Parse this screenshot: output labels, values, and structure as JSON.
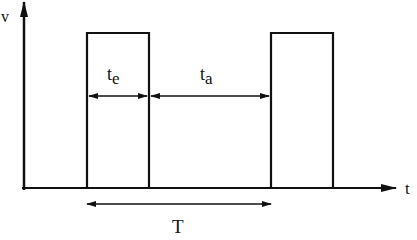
{
  "diagram": {
    "type": "pulse-timing-diagram",
    "axes": {
      "y_label": "v",
      "x_label": "t"
    },
    "labels": {
      "pulse_width": "t",
      "pulse_width_sub": "e",
      "gap": "t",
      "gap_sub": "a",
      "period": "T"
    },
    "pulses": [
      {
        "x_start": 87,
        "x_end": 149
      },
      {
        "x_start": 271,
        "x_end": 333
      }
    ],
    "colors": {
      "stroke": "#111111",
      "background": "#ffffff"
    }
  }
}
